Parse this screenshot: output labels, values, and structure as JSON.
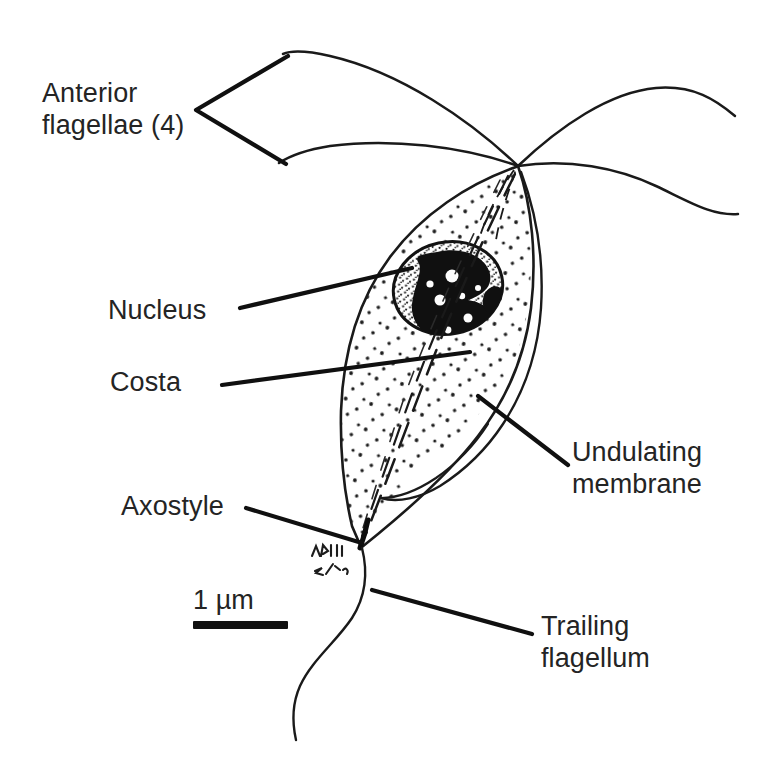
{
  "figure": {
    "style": "black ink line drawing on white background",
    "background_color": "#ffffff",
    "ink_color": "#1a1a1a",
    "text_color": "#242424",
    "artist_mark": "MRH 3/16"
  },
  "labels": {
    "anterior_flagellae": "Anterior\nflagellae (4)",
    "nucleus": "Nucleus",
    "costa": "Costa",
    "undulating_membrane": "Undulating\nmembrane",
    "axostyle": "Axostyle",
    "trailing_flagellum": "Trailing\nflagellum"
  },
  "scale_bar": {
    "label": "1 µm",
    "length_px": 95,
    "thickness_px": 8
  },
  "structures": [
    {
      "name": "cell-body",
      "description": "pear / spindle shaped stippled cytoplasm"
    },
    {
      "name": "nucleus",
      "description": "oval, stippled rim with dark chromatin mass"
    },
    {
      "name": "anterior-flagellae",
      "count": 4,
      "description": "four wavy flagellae radiating from apical point"
    },
    {
      "name": "costa",
      "description": "rod running down cell interior"
    },
    {
      "name": "axostyle",
      "description": "rod exiting the posterior pointed tip"
    },
    {
      "name": "undulating-membrane",
      "description": "fold along the right margin of the cell"
    },
    {
      "name": "trailing-flagellum",
      "description": "single long posterior flagellum"
    }
  ]
}
